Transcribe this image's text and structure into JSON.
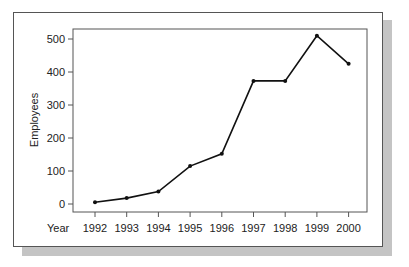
{
  "chart_data": {
    "type": "line",
    "title": "",
    "xlabel": "Year",
    "ylabel": "Employees",
    "categories": [
      "1992",
      "1993",
      "1994",
      "1995",
      "1996",
      "1997",
      "1998",
      "1999",
      "2000"
    ],
    "series": [
      {
        "name": "Employees",
        "values": [
          5,
          18,
          38,
          115,
          152,
          373,
          373,
          510,
          425
        ]
      }
    ],
    "ylim": [
      0,
      500
    ],
    "yticks": [
      0,
      100,
      200,
      300,
      400,
      500
    ],
    "grid": false,
    "legend": "none"
  }
}
